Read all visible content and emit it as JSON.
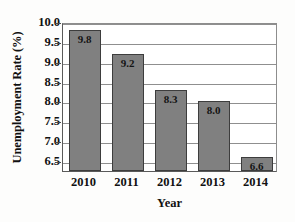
{
  "chart_data": {
    "type": "bar",
    "title": "",
    "subtitle": "",
    "xlabel": "Year",
    "ylabel": "Unemployment Rate (%)",
    "categories": [
      "2010",
      "2011",
      "2012",
      "2013",
      "2014"
    ],
    "values": [
      9.8,
      9.2,
      8.3,
      8.0,
      6.6
    ],
    "data_labels": [
      "9.8",
      "9.2",
      "8.3",
      "8.0",
      "6.6"
    ],
    "ylim": [
      6.25,
      10.0
    ],
    "y_ticks": [
      6.5,
      7.0,
      7.5,
      8.0,
      8.5,
      9.0,
      9.5,
      10.0
    ],
    "y_tick_labels": [
      "6.5",
      "7.0",
      "7.5",
      "8.0",
      "8.5",
      "9.0",
      "9.5",
      "10.0"
    ],
    "grid": true,
    "grid_axis": "y",
    "legend": false,
    "legend_position": "none",
    "series": [
      {
        "name": "Unemployment Rate",
        "values": [
          9.8,
          9.2,
          8.3,
          8.0,
          6.6
        ]
      }
    ]
  },
  "style": {
    "bar_fill": "#808080",
    "bar_border": "#3d3d3d",
    "gridline_color": "#8f8f8f",
    "axis_color": "#5a5a5a",
    "text_color": "#111111",
    "background": "#ffffff"
  }
}
